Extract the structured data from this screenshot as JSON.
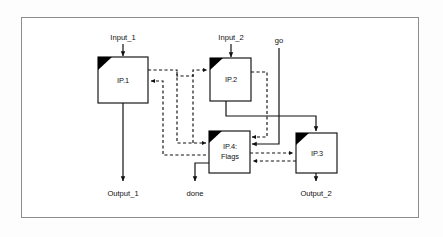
{
  "diagram": {
    "frame": {
      "border_color": "#8d8d8d",
      "background": "#ffffff"
    },
    "page_background": "#fdfdfd",
    "line_color": "#111111",
    "blocks": [
      {
        "id": "ip1",
        "label": "IP.1",
        "label2": "",
        "x": 98,
        "y": 57,
        "w": 50,
        "h": 46
      },
      {
        "id": "ip2",
        "label": "IP.2",
        "label2": "",
        "x": 210,
        "y": 58,
        "w": 41,
        "h": 43
      },
      {
        "id": "ip4",
        "label": "IP.4:",
        "label2": "Flags",
        "x": 209,
        "y": 131,
        "w": 41,
        "h": 42
      },
      {
        "id": "ip3",
        "label": "IP.3",
        "label2": "",
        "x": 296,
        "y": 133,
        "w": 41,
        "h": 40
      }
    ],
    "ports": [
      {
        "id": "input_1",
        "label": "Input_1",
        "x": 123,
        "y": 40,
        "kind": "input"
      },
      {
        "id": "input_2",
        "label": "Input_2",
        "x": 231,
        "y": 40,
        "kind": "input"
      },
      {
        "id": "go",
        "label": "go",
        "x": 279,
        "y": 43,
        "kind": "input"
      },
      {
        "id": "output_1",
        "label": "Output_1",
        "x": 123,
        "y": 194,
        "kind": "output"
      },
      {
        "id": "done",
        "label": "done",
        "x": 195,
        "y": 194,
        "kind": "output"
      },
      {
        "id": "output_2",
        "label": "Output_2",
        "x": 316,
        "y": 194,
        "kind": "output"
      }
    ],
    "connections": [
      {
        "id": "input1-to-ip1",
        "style": "solid",
        "from": "Input_1",
        "to": "IP.1"
      },
      {
        "id": "input2-to-ip2",
        "style": "solid",
        "from": "Input_2",
        "to": "IP.2"
      },
      {
        "id": "ip1-to-output1",
        "style": "solid",
        "from": "IP.1",
        "to": "Output_1"
      },
      {
        "id": "ip2-to-ip3",
        "style": "solid",
        "from": "IP.2",
        "to": "IP.3"
      },
      {
        "id": "go-to-ip4",
        "style": "solid",
        "from": "go",
        "to": "IP.4: Flags"
      },
      {
        "id": "ip4-to-done",
        "style": "solid",
        "from": "IP.4: Flags",
        "to": "done"
      },
      {
        "id": "ip3-to-output2",
        "style": "solid",
        "from": "IP.3",
        "to": "Output_2"
      },
      {
        "id": "ip1-out-to-ip2-in",
        "style": "dashed",
        "from": "IP.1",
        "to": "IP.2"
      },
      {
        "id": "ip1-out-to-ip4-in",
        "style": "dashed",
        "from": "IP.1",
        "to": "IP.4: Flags"
      },
      {
        "id": "ip2-out-to-ip4-in",
        "style": "dashed",
        "from": "IP.2",
        "to": "IP.4: Flags"
      },
      {
        "id": "ip4-out-to-ip1-in",
        "style": "dashed",
        "from": "IP.4: Flags",
        "to": "IP.1"
      },
      {
        "id": "ip4-out-to-ip3-in",
        "style": "dashed",
        "from": "IP.4: Flags",
        "to": "IP.3"
      },
      {
        "id": "ip3-out-to-ip4-in",
        "style": "dashed",
        "from": "IP.3",
        "to": "IP.4: Flags"
      }
    ]
  }
}
